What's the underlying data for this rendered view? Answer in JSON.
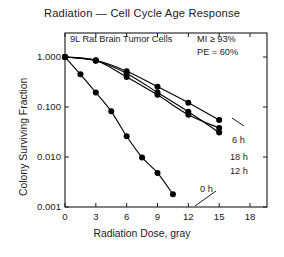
{
  "chart_data": {
    "type": "line",
    "title": "Radiation — Cell Cycle Age Response",
    "subtitle": "9L Rat Brain Tumor Cells",
    "xlabel": "Radiation Dose, gray",
    "ylabel": "Colony Surviving Fraction",
    "yscale": "log",
    "xlim": [
      0,
      18
    ],
    "ylim": [
      0.001,
      1.0
    ],
    "grid": false,
    "legend_position": "inline-right",
    "xticks": [
      0,
      3,
      6,
      9,
      12,
      15,
      18
    ],
    "xticklabels": [
      "0",
      "3",
      "6",
      "9",
      "12",
      "15",
      "18"
    ],
    "yticks": [
      1.0,
      0.1,
      0.01,
      0.001
    ],
    "yticklabels": [
      "1.000",
      "0.100",
      "0.010",
      "0.001"
    ],
    "annotations": [
      {
        "name": "mitotic-index",
        "text": "MI ≥ 93%"
      },
      {
        "name": "plating-efficiency",
        "text": "PE = 60%"
      }
    ],
    "series": [
      {
        "name": "0 h",
        "label": "0 h",
        "marker": "filled-circle",
        "points": [
          {
            "x": 0.0,
            "y": 1.0
          },
          {
            "x": 1.5,
            "y": 0.45
          },
          {
            "x": 3.0,
            "y": 0.195
          },
          {
            "x": 4.5,
            "y": 0.082
          },
          {
            "x": 6.0,
            "y": 0.026
          },
          {
            "x": 7.5,
            "y": 0.0098
          },
          {
            "x": 9.0,
            "y": 0.0048
          },
          {
            "x": 10.5,
            "y": 0.0018
          }
        ]
      },
      {
        "name": "6 h",
        "label": "6 h",
        "marker": "filled-circle",
        "points": [
          {
            "x": 0.0,
            "y": 1.0
          },
          {
            "x": 3.0,
            "y": 0.86
          },
          {
            "x": 6.0,
            "y": 0.52
          },
          {
            "x": 9.0,
            "y": 0.255
          },
          {
            "x": 12.0,
            "y": 0.122
          },
          {
            "x": 15.0,
            "y": 0.055
          }
        ]
      },
      {
        "name": "12 h",
        "label": "12 h",
        "marker": "filled-circle",
        "points": [
          {
            "x": 0.0,
            "y": 1.0
          },
          {
            "x": 3.0,
            "y": 0.84
          },
          {
            "x": 6.0,
            "y": 0.47
          },
          {
            "x": 9.0,
            "y": 0.195
          },
          {
            "x": 12.0,
            "y": 0.08
          },
          {
            "x": 15.0,
            "y": 0.031
          }
        ]
      },
      {
        "name": "18 h",
        "label": "18 h",
        "marker": "filled-circle",
        "points": [
          {
            "x": 0.0,
            "y": 1.0
          },
          {
            "x": 3.0,
            "y": 0.85
          },
          {
            "x": 6.0,
            "y": 0.4
          },
          {
            "x": 9.0,
            "y": 0.175
          },
          {
            "x": 12.0,
            "y": 0.07
          },
          {
            "x": 15.0,
            "y": 0.038
          }
        ]
      }
    ],
    "colors": {
      "axis": "#1a1a1a",
      "marker": "#000000",
      "line": "#000000",
      "background": "#ffffff"
    }
  }
}
